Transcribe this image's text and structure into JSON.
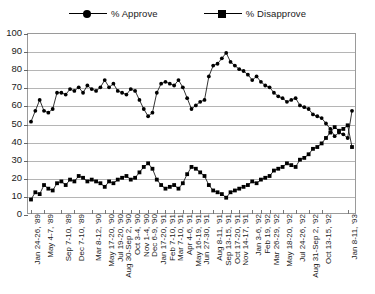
{
  "chart_data": {
    "type": "line",
    "title": "",
    "xlabel": "",
    "ylabel": "",
    "ylim": [
      0,
      100
    ],
    "ytick_step": 10,
    "yticks": [
      0,
      10,
      20,
      30,
      40,
      50,
      60,
      70,
      80,
      90,
      100
    ],
    "grid": true,
    "legend_position": "top-center",
    "legend": [
      "% Approve",
      "% Disapprove"
    ],
    "tick_labels": [
      "Jan 24-26, '89",
      "May 4-7, '89",
      "Sep 7-10, '89",
      "Dec 7-10, '89",
      "Mar 8-12, '90",
      "May 17-20, '90",
      "Jul 19-20, '90",
      "Aug 30-Sep 2, '90",
      "Oct 3-4, '90",
      "Nov 1-4, '90",
      "Dec 6-9, '90",
      "Jan 17-20, '91",
      "Feb 7-10, '91",
      "Mar 7-10, '91",
      "Apr 4-6, '91",
      "May 16-19, '91",
      "Jun 27-30, '91",
      "Aug 8-11, '91",
      "Sep 13-15, '91",
      "Oct 17-20, '91",
      "Nov 14-17, '91",
      "Jan 3-6, '92",
      "Feb 19, '92",
      "Mar 26-29, '92",
      "May 18-20, '92",
      "Jul 24-26, '92",
      "Aug 31-Sep 2, '92",
      "Oct 13-15, '92",
      "Jan 8-11, '93"
    ],
    "tick_label_indices": [
      0,
      3,
      7,
      10,
      14,
      17,
      19,
      21,
      23,
      25,
      27,
      29,
      31,
      33,
      35,
      37,
      39,
      42,
      44,
      46,
      48,
      51,
      53,
      55,
      58,
      61,
      64,
      67,
      73
    ],
    "n_points": 75,
    "series": [
      {
        "name": "% Approve",
        "marker": "circle",
        "values": [
          51,
          57,
          63,
          57,
          56,
          58,
          67,
          67,
          66,
          69,
          68,
          70,
          67,
          71,
          69,
          68,
          70,
          74,
          70,
          72,
          68,
          67,
          66,
          69,
          68,
          63,
          58,
          54,
          56,
          67,
          72,
          73,
          72,
          71,
          74,
          70,
          64,
          58,
          60,
          62,
          63,
          76,
          82,
          83,
          86,
          89,
          84,
          82,
          80,
          79,
          77,
          74,
          76,
          73,
          71,
          70,
          67,
          65,
          64,
          62,
          63,
          64,
          60,
          59,
          58,
          55,
          54,
          53,
          50,
          47,
          43,
          45,
          44,
          42,
          57
        ]
      },
      {
        "name": "% Disapprove",
        "marker": "square",
        "values": [
          8,
          12,
          11,
          16,
          14,
          13,
          17,
          18,
          16,
          19,
          18,
          21,
          20,
          18,
          19,
          18,
          17,
          15,
          18,
          17,
          19,
          20,
          21,
          19,
          20,
          23,
          26,
          28,
          25,
          19,
          16,
          14,
          15,
          16,
          14,
          17,
          22,
          26,
          25,
          23,
          21,
          16,
          13,
          12,
          11,
          9,
          12,
          13,
          14,
          15,
          16,
          18,
          17,
          19,
          20,
          21,
          24,
          25,
          26,
          28,
          27,
          26,
          30,
          31,
          33,
          36,
          37,
          39,
          42,
          45,
          48,
          46,
          47,
          49,
          37
        ]
      }
    ]
  }
}
